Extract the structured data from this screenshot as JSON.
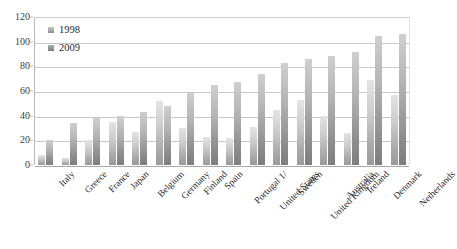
{
  "chart_data": {
    "type": "bar",
    "title": "",
    "subtitle": "",
    "xlabel": "",
    "ylabel": "",
    "ylim": [
      0,
      120
    ],
    "ytick_step": 20,
    "yticks": [
      0,
      20,
      40,
      60,
      80,
      100,
      120
    ],
    "grid": true,
    "grid_axis": "y",
    "legend_position": "top-left",
    "categories": [
      "Italy",
      "Greece",
      "France",
      "Japan",
      "Belgium",
      "Germany",
      "Finland",
      "Spain",
      "Portugal 1/",
      "United States",
      "Sweden",
      "United Kingdom",
      "Australia",
      "Ireland",
      "Denmark",
      "Netherlands"
    ],
    "series": [
      {
        "name": "1998",
        "color": "#b0b0b0",
        "values": [
          8,
          6,
          20,
          35,
          27,
          52,
          30,
          23,
          22,
          31,
          45,
          53,
          40,
          26,
          69,
          57
        ]
      },
      {
        "name": "2009",
        "color": "#8e8e8e",
        "values": [
          20,
          34,
          38,
          40,
          43,
          48,
          58,
          65,
          67,
          74,
          83,
          86,
          88,
          92,
          105,
          106
        ]
      }
    ]
  },
  "legend": {
    "entries": [
      {
        "label": "1998"
      },
      {
        "label": "2009"
      }
    ]
  },
  "colors": {
    "series_1998": "#b0b0b0",
    "series_2009": "#8e8e8e",
    "gridline": "#c8c8c8",
    "axis": "#b9b9b9",
    "text": "#2b2b2b",
    "background": "#ffffff"
  }
}
